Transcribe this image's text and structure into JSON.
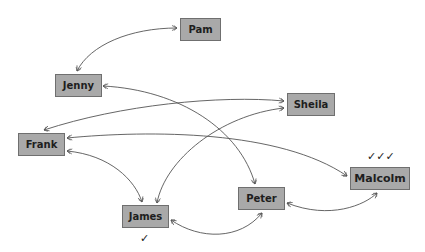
{
  "diagram": {
    "type": "sociogram",
    "nodes": [
      {
        "id": "pam",
        "label": "Pam",
        "ticks": ""
      },
      {
        "id": "jenny",
        "label": "Jenny",
        "ticks": ""
      },
      {
        "id": "sheila",
        "label": "Sheila",
        "ticks": ""
      },
      {
        "id": "frank",
        "label": "Frank",
        "ticks": ""
      },
      {
        "id": "malcolm",
        "label": "Malcolm",
        "ticks": "✓✓✓"
      },
      {
        "id": "peter",
        "label": "Peter",
        "ticks": ""
      },
      {
        "id": "james",
        "label": "James",
        "ticks": "✓"
      }
    ],
    "edges": [
      {
        "from": "pam",
        "to": "jenny",
        "bidirectional": true
      },
      {
        "from": "jenny",
        "to": "peter",
        "bidirectional": true
      },
      {
        "from": "frank",
        "to": "sheila",
        "bidirectional": true
      },
      {
        "from": "james",
        "to": "sheila",
        "bidirectional": true
      },
      {
        "from": "malcolm",
        "to": "frank",
        "bidirectional": true
      },
      {
        "from": "frank",
        "to": "james",
        "bidirectional": true
      },
      {
        "from": "james",
        "to": "peter",
        "bidirectional": true
      },
      {
        "from": "peter",
        "to": "malcolm",
        "bidirectional": true
      }
    ],
    "colors": {
      "node_fill": "#a9a9a9",
      "node_border": "#6f6f6f",
      "edge": "#555555"
    }
  }
}
